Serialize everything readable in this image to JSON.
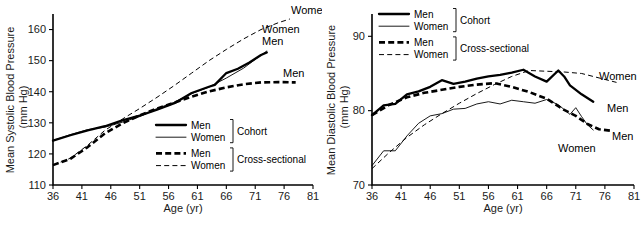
{
  "figure": {
    "panels": [
      "systolic",
      "diastolic"
    ]
  },
  "chart_data": [
    {
      "id": "systolic",
      "type": "line",
      "title": "",
      "xlabel": "Age (yr)",
      "ylabel": "Mean Systolic Blood Pressure (mm Hg)",
      "ylabel_line1": "Mean Systolic Blood Pressure",
      "ylabel_line2": "(mm Hg)",
      "xlim": [
        36,
        81
      ],
      "ylim": [
        110,
        165
      ],
      "xticks": [
        36,
        41,
        46,
        51,
        56,
        61,
        66,
        71,
        76,
        81
      ],
      "yticks": [
        110,
        120,
        130,
        140,
        150,
        160
      ],
      "grid": false,
      "legend_position": "inside-lower-right",
      "legend": {
        "groups": [
          {
            "name": "Cohort",
            "entries": [
              {
                "label": "Men",
                "style": "solid-thick"
              },
              {
                "label": "Women",
                "style": "solid-thin"
              }
            ]
          },
          {
            "name": "Cross-sectional",
            "entries": [
              {
                "label": "Men",
                "style": "dashed-thick"
              },
              {
                "label": "Women",
                "style": "dashed-thin"
              }
            ]
          }
        ]
      },
      "annotations": [
        {
          "text": "Women",
          "series": "cross_sectional_women"
        },
        {
          "text": "Women",
          "series": "cohort_women"
        },
        {
          "text": "Men",
          "series": "cohort_men"
        },
        {
          "text": "Men",
          "series": "cross_sectional_men"
        }
      ],
      "series": [
        {
          "name": "Men",
          "group": "Cohort",
          "key": "cohort_men",
          "style": "solid-thick",
          "x": [
            36,
            39,
            42,
            45,
            48,
            51,
            54,
            57,
            60,
            63,
            64,
            66,
            68,
            70,
            72,
            73
          ],
          "values": [
            124.3,
            126.0,
            127.6,
            128.9,
            130.8,
            132.3,
            134.2,
            136.3,
            139.6,
            141.6,
            142.2,
            146.0,
            147.4,
            149.4,
            151.8,
            152.6
          ]
        },
        {
          "name": "Women",
          "group": "Cohort",
          "key": "cohort_women",
          "style": "solid-thin",
          "x": [
            36,
            39,
            42,
            45,
            48,
            51,
            54,
            57,
            60,
            63,
            66,
            69,
            71,
            73
          ],
          "values": [
            124.3,
            126.2,
            127.8,
            128.6,
            130.2,
            132.0,
            134.6,
            136.6,
            139.4,
            141.5,
            144.4,
            147.6,
            150.4,
            153.1
          ]
        },
        {
          "name": "Men",
          "group": "Cross-sectional",
          "key": "cross_sectional_men",
          "style": "dashed-thick",
          "x": [
            36,
            39,
            42,
            45,
            48,
            51,
            54,
            57,
            60,
            63,
            66,
            69,
            72,
            75,
            78
          ],
          "values": [
            116.4,
            118.4,
            122.2,
            126.6,
            129.8,
            132.4,
            134.6,
            136.5,
            138.4,
            140.1,
            141.4,
            142.4,
            143.0,
            143.1,
            143.0
          ]
        },
        {
          "name": "Women",
          "group": "Cross-sectional",
          "key": "cross_sectional_women",
          "style": "dashed-thin",
          "x": [
            36,
            39,
            42,
            45,
            48,
            51,
            54,
            57,
            60,
            63,
            66,
            69,
            72,
            75,
            77
          ],
          "values": [
            116.4,
            118.6,
            122.8,
            127.6,
            131.2,
            134.6,
            138.2,
            142.0,
            146.0,
            150.0,
            153.6,
            157.0,
            160.0,
            162.2,
            163.4
          ]
        }
      ]
    },
    {
      "id": "diastolic",
      "type": "line",
      "title": "",
      "xlabel": "Age (yr)",
      "ylabel": "Mean Diastolic Blood Pressure (mm Hg)",
      "ylabel_line1": "Mean Diastolic Blood Pressure",
      "ylabel_line2": "(mm Hg)",
      "xlim": [
        36,
        81
      ],
      "ylim": [
        70,
        93
      ],
      "xticks": [
        36,
        41,
        46,
        51,
        56,
        61,
        66,
        71,
        76,
        81
      ],
      "yticks": [
        70,
        80,
        90
      ],
      "grid": false,
      "legend_position": "inside-upper-left",
      "legend": {
        "groups": [
          {
            "name": "Cohort",
            "entries": [
              {
                "label": "Men",
                "style": "solid-thick"
              },
              {
                "label": "Women",
                "style": "solid-thin"
              }
            ]
          },
          {
            "name": "Cross-sectional",
            "entries": [
              {
                "label": "Men",
                "style": "dashed-thick"
              },
              {
                "label": "Women",
                "style": "dashed-thin"
              }
            ]
          }
        ]
      },
      "annotations": [
        {
          "text": "Women",
          "series": "cross_sectional_women"
        },
        {
          "text": "Men",
          "series": "cohort_men"
        },
        {
          "text": "Men",
          "series": "cross_sectional_men"
        },
        {
          "text": "Women",
          "series": "cohort_women"
        }
      ],
      "series": [
        {
          "name": "Men",
          "group": "Cohort",
          "key": "cohort_men",
          "style": "solid-thick",
          "x": [
            36,
            38,
            40,
            42,
            44,
            46,
            48,
            50,
            52,
            54,
            56,
            58,
            60,
            62,
            64,
            66,
            68,
            69,
            70,
            72,
            74
          ],
          "values": [
            79.4,
            80.7,
            80.9,
            82.2,
            82.6,
            83.2,
            84.1,
            83.6,
            83.9,
            84.3,
            84.6,
            84.8,
            85.1,
            85.5,
            84.6,
            83.9,
            85.4,
            84.6,
            83.4,
            82.2,
            81.2
          ]
        },
        {
          "name": "Women",
          "group": "Cohort",
          "key": "cohort_women",
          "style": "solid-thin",
          "x": [
            36,
            38,
            40,
            42,
            44,
            46,
            48,
            50,
            52,
            54,
            56,
            58,
            60,
            62,
            64,
            66,
            68,
            70,
            71,
            72,
            73,
            74
          ],
          "values": [
            72.6,
            74.6,
            74.6,
            76.6,
            78.3,
            79.3,
            79.6,
            80.2,
            80.3,
            80.9,
            81.2,
            80.9,
            81.4,
            81.2,
            81.0,
            81.5,
            80.8,
            79.5,
            80.4,
            79.2,
            78.1,
            77.4
          ]
        },
        {
          "name": "Men",
          "group": "Cross-sectional",
          "key": "cross_sectional_men",
          "style": "dashed-thick",
          "x": [
            36,
            39,
            42,
            45,
            48,
            51,
            54,
            57,
            60,
            63,
            66,
            69,
            71,
            73,
            75,
            77
          ],
          "values": [
            79.4,
            80.8,
            81.8,
            82.4,
            82.8,
            83.2,
            83.5,
            83.7,
            83.2,
            82.5,
            81.6,
            80.1,
            79.3,
            78.2,
            77.5,
            77.3
          ]
        },
        {
          "name": "Women",
          "group": "Cross-sectional",
          "key": "cross_sectional_women",
          "style": "dashed-thin",
          "x": [
            36,
            39,
            42,
            45,
            48,
            51,
            54,
            57,
            60,
            63,
            66,
            69,
            72,
            75,
            78
          ],
          "values": [
            72.2,
            74.4,
            76.4,
            78.1,
            79.6,
            81.0,
            82.3,
            83.5,
            84.6,
            85.4,
            85.3,
            85.2,
            85.0,
            84.4,
            83.8
          ]
        }
      ]
    }
  ]
}
